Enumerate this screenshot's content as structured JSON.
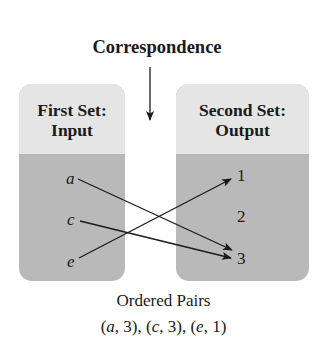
{
  "diagram": {
    "title": "Correspondence",
    "first_set": {
      "header_line1": "First Set:",
      "header_line2": "Input",
      "elements": [
        "a",
        "c",
        "e"
      ]
    },
    "second_set": {
      "header_line1": "Second Set:",
      "header_line2": "Output",
      "elements": [
        "1",
        "2",
        "3"
      ]
    },
    "mappings": [
      {
        "from": "a",
        "to": "3"
      },
      {
        "from": "c",
        "to": "3"
      },
      {
        "from": "e",
        "to": "1"
      }
    ],
    "caption": {
      "label": "Ordered Pairs",
      "pairs_text": "(a, 3), (c, 3), (e, 1)",
      "pairs": [
        {
          "open": "(",
          "x": "a",
          "sep": ", ",
          "y": "3",
          "close": ")"
        },
        {
          "open": "(",
          "x": "c",
          "sep": ", ",
          "y": "3",
          "close": ")"
        },
        {
          "open": "(",
          "x": "e",
          "sep": ", ",
          "y": "1",
          "close": ")"
        }
      ],
      "pair_separator": ", "
    },
    "colors": {
      "header_fill": "#e5e5e5",
      "body_fill": "#b9b9b9",
      "ink": "#1a1a1a"
    }
  }
}
